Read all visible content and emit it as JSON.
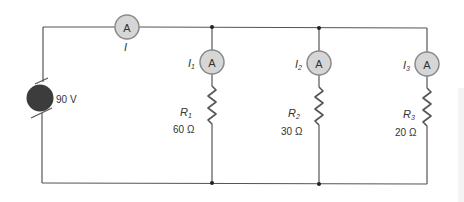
{
  "diagram": {
    "type": "parallel-circuit",
    "source": {
      "label": "90 V",
      "voltage": "90 V"
    },
    "main_ammeter": {
      "symbol": "A",
      "current_label": "I"
    },
    "branches": [
      {
        "ammeter_symbol": "A",
        "current_label": "I",
        "current_sub": "1",
        "resistor_label": "R",
        "resistor_sub": "1",
        "resistance": "60 Ω"
      },
      {
        "ammeter_symbol": "A",
        "current_label": "I",
        "current_sub": "2",
        "resistor_label": "R",
        "resistor_sub": "2",
        "resistance": "30 Ω"
      },
      {
        "ammeter_symbol": "A",
        "current_label": "I",
        "current_sub": "3",
        "resistor_label": "R",
        "resistor_sub": "3",
        "resistance": "20 Ω"
      }
    ],
    "colors": {
      "wire": "#555555",
      "ammeter_fill": "#d6d6d6",
      "ammeter_stroke": "#8a8a8a",
      "battery_fill": "#3c3c3c",
      "text": "#333333"
    }
  }
}
